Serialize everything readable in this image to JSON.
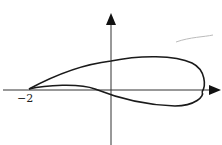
{
  "diagram": {
    "type": "airfoil-curve",
    "x_axis_label_tick": "−2",
    "colors": {
      "stroke": "#1a1a1a",
      "background": "#ffffff",
      "smudge": "#bbbbbb"
    }
  }
}
